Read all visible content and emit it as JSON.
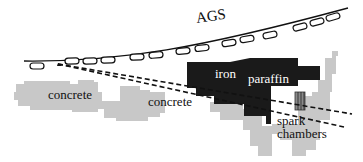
{
  "diagram": {
    "labels": {
      "ags": "AGS",
      "concrete_left": "concrete",
      "concrete_center": "concrete",
      "iron": "iron",
      "paraffin": "paraffin",
      "spark": "spark",
      "chambers": "chambers"
    },
    "colors": {
      "concrete": "#c8c8c8",
      "iron": "#1a1a1a",
      "beam_line": "#111111",
      "magnet_fill": "#ffffff",
      "background": "#ffffff"
    }
  }
}
